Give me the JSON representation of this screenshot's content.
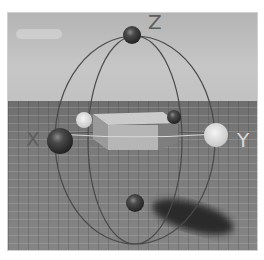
{
  "viewport": {
    "type": "3d-rotate-gizmo",
    "axis_labels": {
      "z": "Z",
      "x": "X",
      "y": "Y"
    },
    "colors": {
      "sky": "#bcbcbc",
      "floor": "#7a7a7a",
      "ring": "#4a4a4a",
      "box_front": "#b0b0b0",
      "box_top": "#c8c8c8",
      "box_side": "#888888",
      "handle_dark": "#3c3c3c",
      "handle_light": "#dedede",
      "shadow": "#2a2a2a"
    }
  }
}
